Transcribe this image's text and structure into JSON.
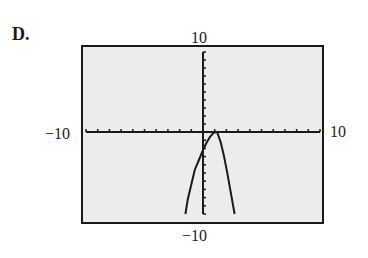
{
  "panel": {
    "label": "D."
  },
  "window": {
    "xmin_label": "−10",
    "xmax_label": "10",
    "ymin_label": "−10",
    "ymax_label": "10"
  },
  "colors": {
    "screen_bg": "#ececec",
    "ink": "#1a1a1a"
  },
  "chart_data": {
    "type": "line",
    "title": "",
    "xlabel": "",
    "ylabel": "",
    "xlim": [
      -10,
      10
    ],
    "ylim": [
      -10,
      10
    ],
    "grid": false,
    "ticks": {
      "x_step": 1,
      "y_step": 1
    },
    "series": [
      {
        "name": "graph",
        "x": [
          -1.5,
          -1.3,
          -1.0,
          -0.7,
          -0.4,
          0.0,
          0.3,
          0.6,
          0.9,
          1.2,
          1.5,
          1.8,
          2.1,
          2.4,
          2.7
        ],
        "y": [
          -10,
          -8.2,
          -6.4,
          -4.6,
          -3.6,
          -2.2,
          -1.3,
          -0.6,
          -0.1,
          0.0,
          -1.2,
          -3.0,
          -5.2,
          -7.6,
          -10
        ]
      }
    ]
  }
}
